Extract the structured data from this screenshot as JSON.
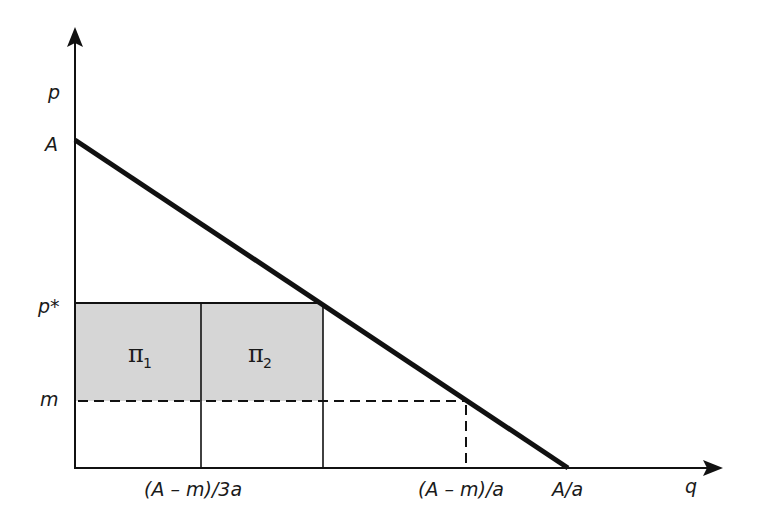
{
  "diagram": {
    "type": "economics-demand-profit-diagram",
    "axes": {
      "y_label": "p",
      "x_label": "q"
    },
    "y_ticks": {
      "A": "A",
      "p_star": "p*",
      "m": "m"
    },
    "x_ticks": {
      "third": "(A – m)/3a",
      "full": "(A – m)/a",
      "intercept": "A/a"
    },
    "regions": [
      {
        "id": "pi1",
        "symbol": "π",
        "subscript": "1"
      },
      {
        "id": "pi2",
        "symbol": "π",
        "subscript": "2"
      }
    ],
    "colors": {
      "shade": "#d6d6d6",
      "line": "#111111"
    }
  }
}
